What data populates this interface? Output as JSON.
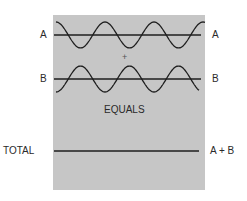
{
  "figure": {
    "panel_color": "#c6c6c6",
    "line_color": "#1e1e1e",
    "waves": [
      {
        "id": "A",
        "label_left": "A",
        "label_right": "A",
        "baseline_y": 35,
        "amplitude": 13,
        "phase": "starts-high",
        "cycles": 3
      },
      {
        "id": "B",
        "label_left": "B",
        "label_right": "B",
        "baseline_y": 79,
        "amplitude": 13,
        "phase": "starts-low",
        "cycles": 3
      }
    ],
    "plus_sign": "+",
    "equals_text": "EQUALS",
    "total": {
      "label_left": "TOTAL",
      "label_right": "A + B",
      "baseline_y": 151
    }
  }
}
